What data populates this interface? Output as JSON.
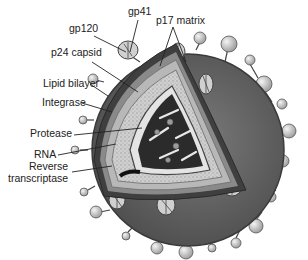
{
  "diagram": {
    "labels": {
      "gp120": "gp120",
      "gp41": "gp41",
      "p17_matrix": "p17 matrix",
      "p24_capsid": "p24 capsid",
      "lipid_bilayer": "Lipid bilayer",
      "integrase": "Integrase",
      "protease": "Protease",
      "rna": "RNA",
      "reverse_transcriptase_line1": "Reverse",
      "reverse_transcriptase_line2": "transcriptase"
    },
    "colors": {
      "envelope": "#5a5a5a",
      "envelope_edge": "#3a3a3a",
      "bilayer_band": "#8a8a8a",
      "matrix_band": "#b8b8b8",
      "capsid_fill": "#d2d2d2",
      "core_dark": "#2b2b2b",
      "spike_head": "#d8d8d8",
      "label_text": "#222222",
      "leader_line": "#222222"
    }
  }
}
